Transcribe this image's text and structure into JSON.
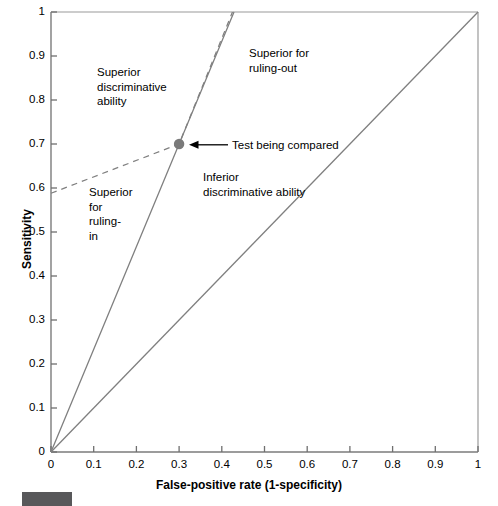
{
  "chart_data": {
    "type": "line",
    "title": "",
    "xlabel": "False-positive rate (1-specificity)",
    "ylabel": "Sensitivity",
    "xlim": [
      0,
      1
    ],
    "ylim": [
      0,
      1
    ],
    "grid": false,
    "legend_position": "none",
    "xticks": [
      "0",
      "0.1",
      "0.2",
      "0.3",
      "0.4",
      "0.5",
      "0.6",
      "0.7",
      "0.8",
      "0.9",
      "1"
    ],
    "xtick_values": [
      0,
      0.1,
      0.2,
      0.3,
      0.4,
      0.5,
      0.6,
      0.7,
      0.8,
      0.9,
      1
    ],
    "yticks": [
      "0",
      "0.1",
      "0.2",
      "0.3",
      "0.4",
      "0.5",
      "0.6",
      "0.7",
      "0.8",
      "0.9",
      "1"
    ],
    "ytick_values": [
      0,
      0.1,
      0.2,
      0.3,
      0.4,
      0.5,
      0.6,
      0.7,
      0.8,
      0.9,
      1
    ],
    "series": [
      {
        "name": "chance-diagonal",
        "style": "solid",
        "color": "#808080",
        "x": [
          0,
          1
        ],
        "y": [
          0,
          1
        ]
      },
      {
        "name": "positive-likelihood-ratio-line",
        "style": "solid",
        "color": "#808080",
        "x": [
          0,
          0.3,
          0.4286
        ],
        "y": [
          0,
          0.7,
          1.0
        ]
      },
      {
        "name": "negative-likelihood-ratio-line",
        "style": "dashed",
        "color": "#808080",
        "x": [
          0,
          0.3,
          0.425
        ],
        "y": [
          0.588,
          0.7,
          1.0
        ]
      }
    ],
    "points": [
      {
        "name": "test-being-compared",
        "x": 0.3,
        "y": 0.7,
        "color": "#7a7a7a",
        "label": "Test being compared"
      }
    ],
    "annotations": [
      {
        "name": "superior-discriminative-ability",
        "text": "Superior\ndiscriminative\nability",
        "x": 0.108,
        "y": 0.88
      },
      {
        "name": "superior-for-ruling-out",
        "text": "Superior for\nruling-out",
        "x": 0.464,
        "y": 0.925
      },
      {
        "name": "superior-for-ruling-in",
        "text": "Superior\nfor\nruling-\nin",
        "x": 0.089,
        "y": 0.61
      },
      {
        "name": "inferior-discriminative-ability",
        "text": "Inferior\ndiscriminative ability",
        "x": 0.356,
        "y": 0.645
      }
    ]
  },
  "axes": {
    "x_title": "False-positive rate (1-specificity)",
    "y_title": "Sensitivity"
  },
  "labels": {
    "superior_discriminative": "Superior\ndiscriminative\nability",
    "superior_ruling_out": "Superior for\nruling-out",
    "superior_ruling_in": "Superior\nfor\nruling-\nin",
    "inferior_discriminative": "Inferior\ndiscriminative ability",
    "test_being_compared": "Test being compared"
  },
  "colors": {
    "line": "#808080",
    "dashed_line": "#8a8a8a",
    "point": "#7a7a7a",
    "axis": "#707070",
    "text": "#000000",
    "figure_marker": "#58585a"
  }
}
